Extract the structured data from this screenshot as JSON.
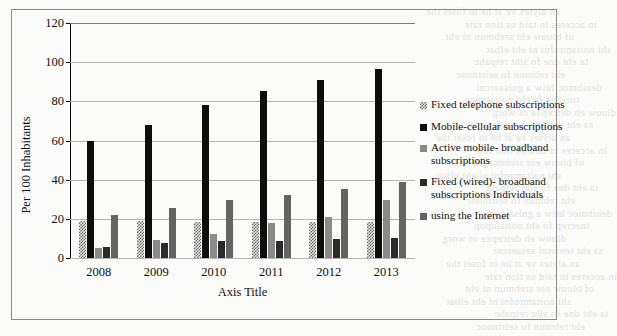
{
  "chart_data": {
    "type": "bar",
    "title": "",
    "xlabel": "Axis Title",
    "ylabel": "Per 100 Inhabitants",
    "ylim": [
      0,
      120
    ],
    "ytick_step": 20,
    "yticks": [
      "0",
      "20",
      "40",
      "60",
      "80",
      "100",
      "120"
    ],
    "grid": true,
    "legend_position": "right",
    "categories": [
      "2008",
      "2009",
      "2010",
      "2011",
      "2012",
      "2013"
    ],
    "series": [
      {
        "name": "Fixed telephone subscriptions",
        "color": "#8a8a88",
        "pattern": "checkerboard",
        "values": [
          19,
          19,
          18.5,
          18.5,
          18.5,
          18.5
        ]
      },
      {
        "name": "Mobile-cellular subscriptions",
        "color": "#0d0d0d",
        "pattern": "solid",
        "values": [
          60,
          68,
          78,
          85.5,
          91,
          96.5
        ]
      },
      {
        "name": "Active mobile- broadband subscriptions",
        "color": "#8a8a88",
        "pattern": "solid",
        "values": [
          5,
          9,
          12.5,
          18,
          21,
          29.5
        ]
      },
      {
        "name": "Fixed (wired)- broadband subscriptions Individuals",
        "color": "#2b2b2b",
        "pattern": "solid",
        "values": [
          5.5,
          7.5,
          8.5,
          8.5,
          9.5,
          10
        ]
      },
      {
        "name": "using the Internet",
        "color": "#636361",
        "pattern": "solid",
        "values": [
          22,
          25.5,
          29.5,
          32,
          35,
          39
        ]
      }
    ]
  },
  "legend": {
    "items": [
      {
        "label": "Fixed telephone subscriptions"
      },
      {
        "label": "Mobile-cellular subscriptions"
      },
      {
        "label": "Active mobile- broadband subscriptions"
      },
      {
        "label": "Fixed (wired)- broadband subscriptions Individuals"
      },
      {
        "label": "using the Internet"
      }
    ]
  },
  "background_text": {
    "lines": [
      "an alytes ve at he in fosei the",
      "in acceres in taid us tion rate",
      "of bluow eht srebmun ni eht",
      "shi noitamrofni ni eht elbat",
      "ta eht dne fo siht retpahc",
      "eht rebmun fo seirtnuoc",
      "denibmoc htiw a gnisaercni",
      "tnecrep fo eht noitalupop",
      "dluow eb detcepxe ot worg",
      "sa eht tenretni sesaercni"
    ]
  }
}
